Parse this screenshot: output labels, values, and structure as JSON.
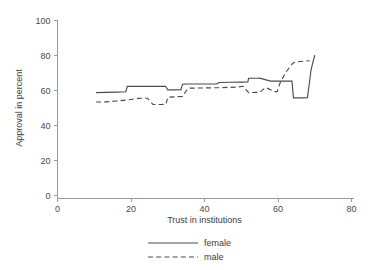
{
  "chart_data": {
    "type": "line",
    "title": "",
    "xlabel": "Trust in institutions",
    "ylabel": "Approval in percent",
    "xlim": [
      0,
      80
    ],
    "ylim": [
      0,
      100
    ],
    "xticks": [
      0,
      20,
      40,
      60,
      80
    ],
    "yticks": [
      0,
      20,
      40,
      60,
      80,
      100
    ],
    "xtick_labels": [
      "0",
      "20",
      "40",
      "60",
      "80"
    ],
    "ytick_labels": [
      "0",
      "20",
      "40",
      "60",
      "80",
      "100"
    ],
    "grid": false,
    "legend_position": "bottom-center",
    "legend_entries": [
      "female",
      "male"
    ],
    "series": [
      {
        "name": "female",
        "style": "solid",
        "color": "#4b4b4b",
        "x": [
          10.5,
          13.0,
          16.0,
          18.6,
          19.0,
          23.0,
          27.0,
          29.4,
          30.0,
          31.5,
          33.6,
          34.0,
          35.2,
          38.0,
          41.0,
          43.4,
          44.0,
          47.0,
          50.0,
          51.8,
          52.0,
          54.6,
          55.0,
          58.0,
          61.0,
          63.8,
          64.2,
          65.0,
          66.5,
          68.0,
          68.4,
          69.0,
          70.0
        ],
        "y": [
          58.8,
          58.9,
          59.1,
          59.3,
          62.4,
          62.4,
          62.4,
          62.4,
          60.4,
          60.4,
          60.5,
          63.6,
          63.7,
          63.7,
          63.7,
          63.8,
          64.6,
          64.7,
          64.8,
          64.9,
          67.0,
          67.0,
          67.1,
          65.4,
          65.4,
          65.4,
          55.8,
          55.8,
          55.8,
          55.9,
          62.0,
          72.0,
          80.2
        ]
      },
      {
        "name": "male",
        "style": "dashed",
        "color": "#4b4b4b",
        "x": [
          10.5,
          13.0,
          16.0,
          19.0,
          22.0,
          23.5,
          24.5,
          26.0,
          28.0,
          29.5,
          30.0,
          32.0,
          34.0,
          35.5,
          38.0,
          41.0,
          44.0,
          47.0,
          49.0,
          50.5,
          52.0,
          54.0,
          55.0,
          56.4,
          57.0,
          59.0,
          59.8,
          60.5,
          62.0,
          64.0,
          65.0,
          66.0,
          67.5,
          68.6
        ],
        "y": [
          53.4,
          53.5,
          54.0,
          54.6,
          55.5,
          55.6,
          55.6,
          52.0,
          52.0,
          52.1,
          56.2,
          56.4,
          56.6,
          61.3,
          61.4,
          61.5,
          61.6,
          61.8,
          62.0,
          62.4,
          58.8,
          58.9,
          58.9,
          61.4,
          61.4,
          59.4,
          59.4,
          64.0,
          70.0,
          75.6,
          76.4,
          76.6,
          76.8,
          77.0
        ]
      }
    ]
  },
  "legend": {
    "female_label": "female",
    "male_label": "male"
  },
  "axes": {
    "x_title": "Trust in institutions",
    "y_title": "Approval in percent"
  }
}
